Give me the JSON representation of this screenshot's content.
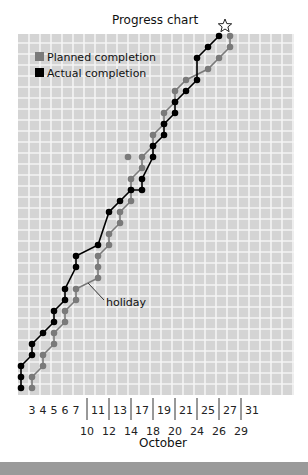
{
  "chart_data": {
    "type": "line",
    "title": "Progress chart",
    "xlabel": "October",
    "ylabel": "",
    "grid": true,
    "legend": {
      "placement": "top-left",
      "entries": [
        {
          "name": "Planned completion",
          "color": "#7a7a7a"
        },
        {
          "name": "Actual completion",
          "color": "#000000"
        }
      ]
    },
    "x_tick_labels_upper": [
      "3",
      "4",
      "5",
      "6",
      "7",
      "11",
      "13",
      "17",
      "19",
      "21",
      "25",
      "27",
      "31"
    ],
    "x_tick_labels_lower": [
      "10",
      "12",
      "14",
      "18",
      "20",
      "24",
      "26",
      "29"
    ],
    "x_columns": [
      "",
      "3",
      "4",
      "5",
      "6",
      "7",
      "10",
      "11",
      "12",
      "13",
      "14",
      "17",
      "18",
      "19",
      "20",
      "21",
      "24",
      "25",
      "26",
      "27",
      "29",
      "31"
    ],
    "ylim": [
      0,
      32
    ],
    "xlim": [
      0,
      25
    ],
    "series": [
      {
        "name": "Actual completion",
        "color": "#000000",
        "points": [
          [
            0,
            0
          ],
          [
            0,
            1
          ],
          [
            0,
            2
          ],
          [
            1,
            3
          ],
          [
            1,
            4
          ],
          [
            2,
            5
          ],
          [
            3,
            6
          ],
          [
            3,
            7
          ],
          [
            4,
            8
          ],
          [
            4,
            9
          ],
          [
            5,
            11
          ],
          [
            5,
            12
          ],
          [
            7,
            13
          ],
          [
            8,
            16
          ],
          [
            9,
            17
          ],
          [
            10,
            18
          ],
          [
            11,
            18
          ],
          [
            11,
            19
          ],
          [
            12,
            21
          ],
          [
            12,
            22
          ],
          [
            13,
            23
          ],
          [
            13,
            24
          ],
          [
            14,
            25
          ],
          [
            14,
            26
          ],
          [
            15,
            27
          ],
          [
            16,
            28
          ],
          [
            16,
            30
          ],
          [
            17,
            31
          ],
          [
            18,
            32
          ]
        ]
      },
      {
        "name": "Planned completion",
        "color": "#7a7a7a",
        "points": [
          [
            1,
            0
          ],
          [
            1,
            1
          ],
          [
            2,
            2
          ],
          [
            2,
            3
          ],
          [
            3,
            4
          ],
          [
            3,
            5
          ],
          [
            4,
            6
          ],
          [
            4,
            7
          ],
          [
            5,
            8
          ],
          [
            5,
            9
          ],
          [
            7,
            10
          ],
          [
            7,
            11
          ],
          [
            7,
            12
          ],
          [
            8,
            13
          ],
          [
            8,
            14
          ],
          [
            9,
            15
          ],
          [
            9,
            16
          ],
          [
            10,
            17
          ],
          [
            10,
            18
          ],
          [
            10,
            19
          ],
          [
            11,
            20
          ],
          [
            11,
            21
          ],
          [
            12,
            22
          ],
          [
            12,
            23
          ],
          [
            13,
            24
          ],
          [
            13,
            25
          ],
          [
            14,
            26
          ],
          [
            14,
            27
          ],
          [
            15,
            28
          ],
          [
            17,
            29
          ],
          [
            18,
            30
          ],
          [
            19,
            31
          ],
          [
            19,
            32
          ]
        ]
      }
    ],
    "stray_points": [
      {
        "series": "Planned completion",
        "point": [
          10,
          21
        ]
      }
    ],
    "annotations": [
      {
        "text": "holiday",
        "target": [
          6,
          10.5
        ]
      },
      {
        "text": "star-marker",
        "target": [
          18.5,
          33
        ]
      }
    ]
  }
}
